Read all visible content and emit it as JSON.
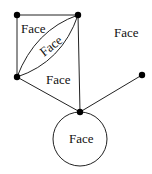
{
  "diagram": {
    "labels": {
      "face_top_left": "Face",
      "face_lens": "Face",
      "face_outer": "Face",
      "face_middle": "Face",
      "face_loop": "Face"
    },
    "nodes": [
      "top-left",
      "top-right",
      "middle-left",
      "bottom-center",
      "right"
    ],
    "edges": [
      [
        "top-left",
        "top-right"
      ],
      [
        "top-left",
        "middle-left"
      ],
      [
        "middle-left",
        "top-right",
        "curve-upper"
      ],
      [
        "middle-left",
        "top-right",
        "curve-lower"
      ],
      [
        "top-right",
        "bottom-center"
      ],
      [
        "middle-left",
        "bottom-center"
      ],
      [
        "bottom-center",
        "right"
      ],
      [
        "bottom-center",
        "bottom-center",
        "loop"
      ]
    ]
  }
}
